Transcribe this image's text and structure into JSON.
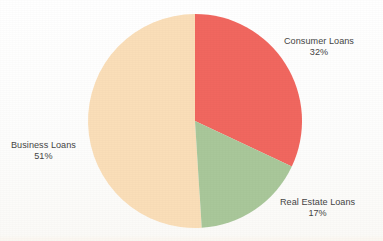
{
  "chart_data": {
    "type": "pie",
    "title": "",
    "subtitle": "",
    "xlabel": "",
    "ylabel": "",
    "legend_position": "none",
    "labels_position": "outside",
    "grid": false,
    "start_angle_deg": 0,
    "direction": "clockwise",
    "categories": [
      "Consumer Loans",
      "Real Estate Loans",
      "Business Loans"
    ],
    "values": [
      32,
      17,
      51
    ],
    "unit": "%",
    "slices": [
      {
        "name": "Consumer Loans",
        "value": 32,
        "value_label": "32%",
        "color": "#f1675f",
        "color_name": "salmon-red",
        "start_angle_deg": 0,
        "end_angle_deg": 115.2,
        "label_anchor": "upper-right"
      },
      {
        "name": "Real Estate Loans",
        "value": 17,
        "value_label": "17%",
        "color": "#a9c79a",
        "color_name": "sage-green",
        "start_angle_deg": 115.2,
        "end_angle_deg": 176.4,
        "label_anchor": "lower-right"
      },
      {
        "name": "Business Loans",
        "value": 51,
        "value_label": "51%",
        "color": "#fadeb8",
        "color_name": "cream",
        "start_angle_deg": 176.4,
        "end_angle_deg": 360,
        "label_anchor": "left"
      }
    ]
  },
  "figure": {
    "background_color": "#fefefe",
    "text_color": "#454545",
    "center_x": 195,
    "center_y": 121,
    "radius": 107
  }
}
